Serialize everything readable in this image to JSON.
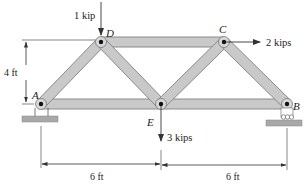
{
  "diagram": {
    "type": "planar truss",
    "colors": {
      "member_fill": "#c9c9c9",
      "member_stroke": "#8a8a8a",
      "ground_fill": "#a8a8a8",
      "line": "#333333",
      "joint_pin": "#111111"
    },
    "joints": [
      {
        "id": "A",
        "label": "A",
        "x": 41,
        "y": 104
      },
      {
        "id": "D",
        "label": "D",
        "x": 101,
        "y": 42
      },
      {
        "id": "C",
        "label": "C",
        "x": 224,
        "y": 42
      },
      {
        "id": "E",
        "label": "E",
        "x": 161,
        "y": 104
      },
      {
        "id": "B",
        "label": "B",
        "x": 287,
        "y": 104
      }
    ],
    "members": [
      {
        "from": "A",
        "to": "D"
      },
      {
        "from": "D",
        "to": "E"
      },
      {
        "from": "D",
        "to": "C"
      },
      {
        "from": "E",
        "to": "C"
      },
      {
        "from": "C",
        "to": "B"
      },
      {
        "from": "A",
        "to": "E"
      },
      {
        "from": "E",
        "to": "B"
      }
    ],
    "supports": [
      {
        "joint": "A",
        "type": "pin"
      },
      {
        "joint": "B",
        "type": "roller"
      }
    ],
    "loads": [
      {
        "joint": "D",
        "label": "1 kip",
        "direction": "down"
      },
      {
        "joint": "C",
        "label": "2 kips",
        "direction": "right"
      },
      {
        "joint": "E",
        "label": "3 kips",
        "direction": "down"
      }
    ],
    "dimensions": {
      "height": "4 ft",
      "left_span": "6 ft",
      "right_span": "6 ft"
    }
  }
}
